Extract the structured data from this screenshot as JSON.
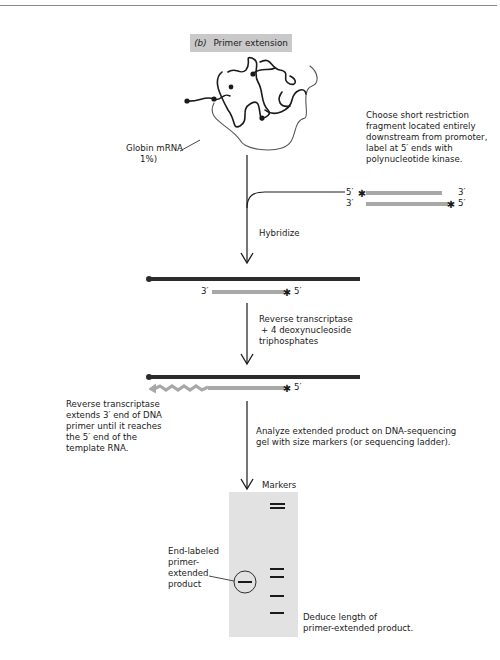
{
  "figure": {
    "panel_label": "(b)",
    "panel_title": "Primer extension",
    "mrna_label_line1": "Globin mRNA",
    "mrna_label_line2": "1%)",
    "probe_instructions": [
      "Choose short restriction",
      "fragment located entirely",
      "downstream from promoter,",
      "label at 5′ ends with",
      "polynucleotide kinase."
    ],
    "probe_ends": {
      "top_left": "5′",
      "top_right": "3′",
      "bottom_left": "3′",
      "bottom_right": "5′"
    },
    "step1_label": "Hybridize",
    "hybrid_primer_left": "3′",
    "hybrid_primer_right": "5′",
    "step2_label": [
      "Reverse transcriptase",
      "+ 4 deoxynucleoside",
      "triphosphates"
    ],
    "extended_primer_right": "5′",
    "extension_note": [
      "Reverse transcriptase",
      "extends 3′ end of DNA",
      "primer until it reaches",
      "the 5′ end of the",
      "template RNA."
    ],
    "step3_label": [
      "Analyze extended product on DNA-sequencing",
      "gel with size markers (or sequencing ladder)."
    ],
    "gel": {
      "markers_label": "Markers",
      "product_label": [
        "End-labeled",
        "primer-",
        "extended",
        "product"
      ],
      "marker_bands_y": [
        504,
        508,
        569,
        577,
        596,
        613
      ],
      "product_band_y": 582
    },
    "conclusion": [
      "Deduce length of",
      "primer-extended product."
    ],
    "colors": {
      "dna_strand": "#2b2b2b",
      "primer": "#a8a8a8",
      "title_box": "#c9c9c9",
      "gel": "#e2e2e2"
    }
  }
}
